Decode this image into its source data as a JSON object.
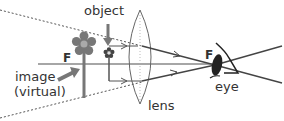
{
  "diagram": {
    "type": "optics-ray-diagram",
    "labels": {
      "object": "object",
      "image": "image",
      "image_sub": "(virtual)",
      "lens": "lens",
      "eye": "eye",
      "focal_left": "F",
      "focal_right": "F"
    },
    "colors": {
      "axis": "#888888",
      "ray": "#555555",
      "image_flower": "#777777",
      "object_flower": "#444444",
      "dotted": "#555555",
      "eye": "#222222",
      "arrow": "#777777",
      "text": "#333333"
    }
  }
}
